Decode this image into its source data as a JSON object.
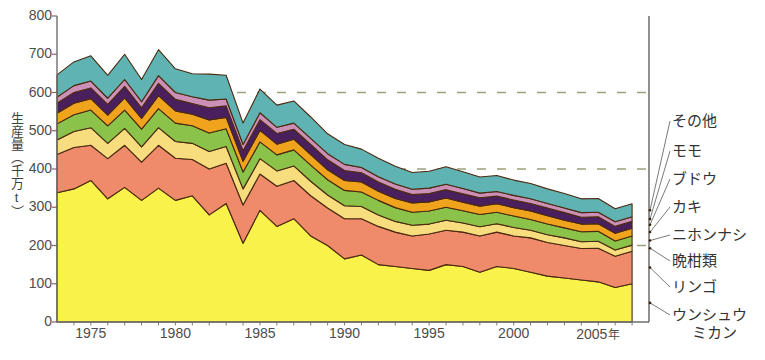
{
  "chart_data": {
    "type": "area",
    "stacked": true,
    "title": "",
    "xlabel": "年",
    "ylabel": "生産量（千万t）",
    "ylim": [
      0,
      800
    ],
    "yticks": [
      0,
      100,
      200,
      300,
      400,
      500,
      600,
      700,
      800
    ],
    "gridlines_dashed_at": [
      200,
      400,
      600
    ],
    "grid": true,
    "legend_position": "right",
    "xlim": [
      1973,
      2008
    ],
    "xticks": [
      1975,
      1980,
      1985,
      1990,
      1995,
      2000,
      2005
    ],
    "xticklabels": [
      "1975",
      "1980",
      "1985",
      "1990",
      "1995",
      "2000",
      "2005"
    ],
    "x_axis_unit": "年",
    "x": [
      1973,
      1974,
      1975,
      1976,
      1977,
      1978,
      1979,
      1980,
      1981,
      1982,
      1983,
      1984,
      1985,
      1986,
      1987,
      1988,
      1989,
      1990,
      1991,
      1992,
      1993,
      1994,
      1995,
      1996,
      1997,
      1998,
      1999,
      2000,
      2001,
      2002,
      2003,
      2004,
      2005,
      2006,
      2007
    ],
    "series": [
      {
        "name": "ウンシュウミカン",
        "color": "#f8f24a",
        "values": [
          338,
          348,
          370,
          322,
          352,
          318,
          350,
          318,
          330,
          280,
          310,
          206,
          292,
          250,
          270,
          225,
          200,
          165,
          175,
          150,
          145,
          140,
          135,
          150,
          145,
          130,
          145,
          140,
          130,
          120,
          115,
          110,
          105,
          90,
          100
        ]
      },
      {
        "name": "リンゴ",
        "color": "#ef8a6a",
        "values": [
          100,
          108,
          92,
          105,
          110,
          100,
          112,
          110,
          95,
          120,
          105,
          100,
          95,
          105,
          100,
          105,
          98,
          105,
          95,
          100,
          90,
          85,
          95,
          90,
          90,
          95,
          90,
          85,
          90,
          88,
          85,
          82,
          88,
          82,
          85
        ]
      },
      {
        "name": "晩柑類",
        "color": "#f8dd7e",
        "values": [
          38,
          42,
          46,
          40,
          44,
          40,
          46,
          44,
          42,
          46,
          44,
          42,
          40,
          40,
          38,
          38,
          34,
          34,
          32,
          30,
          28,
          28,
          26,
          26,
          24,
          24,
          22,
          22,
          20,
          20,
          20,
          18,
          18,
          16,
          16
        ]
      },
      {
        "name": "ニホンナシ",
        "color": "#8bc34a",
        "values": [
          42,
          44,
          46,
          46,
          48,
          46,
          50,
          48,
          46,
          48,
          46,
          44,
          44,
          42,
          42,
          42,
          40,
          40,
          38,
          38,
          36,
          34,
          34,
          34,
          32,
          32,
          30,
          30,
          28,
          28,
          26,
          26,
          26,
          24,
          24
        ]
      },
      {
        "name": "カキ",
        "color": "#f0a41e",
        "values": [
          28,
          30,
          30,
          28,
          32,
          28,
          34,
          32,
          30,
          34,
          30,
          28,
          30,
          28,
          28,
          28,
          26,
          26,
          26,
          24,
          24,
          24,
          24,
          24,
          22,
          22,
          22,
          22,
          22,
          22,
          20,
          20,
          20,
          20,
          20
        ]
      },
      {
        "name": "ブドウ",
        "color": "#4a1f5e",
        "values": [
          26,
          28,
          28,
          28,
          30,
          28,
          32,
          30,
          28,
          32,
          30,
          28,
          28,
          28,
          26,
          26,
          26,
          26,
          24,
          24,
          24,
          22,
          22,
          22,
          22,
          22,
          20,
          20,
          20,
          20,
          20,
          18,
          18,
          18,
          18
        ]
      },
      {
        "name": "モモ",
        "color": "#cc8fb6",
        "values": [
          16,
          18,
          18,
          16,
          18,
          16,
          20,
          18,
          18,
          20,
          18,
          16,
          18,
          16,
          16,
          16,
          16,
          16,
          14,
          14,
          14,
          14,
          14,
          14,
          14,
          12,
          12,
          12,
          12,
          12,
          12,
          12,
          12,
          12,
          12
        ]
      },
      {
        "name": "その他",
        "color": "#5fb3b3",
        "values": [
          58,
          62,
          66,
          60,
          66,
          58,
          68,
          62,
          60,
          68,
          62,
          56,
          62,
          58,
          58,
          56,
          52,
          52,
          48,
          48,
          46,
          44,
          44,
          46,
          44,
          42,
          42,
          40,
          40,
          38,
          38,
          36,
          36,
          34,
          34
        ]
      }
    ]
  },
  "axis": {
    "ylabel": "生産量（千万t）",
    "ytick_labels": [
      "0",
      "100",
      "200",
      "300",
      "400",
      "500",
      "600",
      "700",
      "800"
    ],
    "xtick_labels": [
      "1975",
      "1980",
      "1985",
      "1990",
      "1995",
      "2000",
      "2005"
    ],
    "x_unit_suffix": "年"
  },
  "legend": {
    "items": [
      {
        "label": "その他",
        "color": "#5fb3b3",
        "line1": "その他",
        "line2": ""
      },
      {
        "label": "モモ",
        "color": "#cc8fb6",
        "line1": "モモ",
        "line2": ""
      },
      {
        "label": "ブドウ",
        "color": "#4a1f5e",
        "line1": "ブドウ",
        "line2": ""
      },
      {
        "label": "カキ",
        "color": "#f0a41e",
        "line1": "カキ",
        "line2": ""
      },
      {
        "label": "ニホンナシ",
        "color": "#8bc34a",
        "line1": "ニホンナシ",
        "line2": ""
      },
      {
        "label": "晩柑類",
        "color": "#f8dd7e",
        "line1": "晩柑類",
        "line2": ""
      },
      {
        "label": "リンゴ",
        "color": "#ef8a6a",
        "line1": "リンゴ",
        "line2": ""
      },
      {
        "label": "ウンシュウミカン",
        "color": "#f8f24a",
        "line1": "ウンシュウ",
        "line2": "ミカン"
      }
    ]
  },
  "colors": {
    "axis": "#6e6e6e",
    "grid_dash": "#9aa17a",
    "outline": "#4a2a10",
    "text": "#4d4d4d",
    "background": "#ffffff"
  }
}
